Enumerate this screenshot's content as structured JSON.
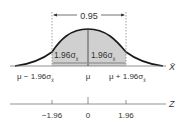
{
  "diagram": {
    "bracket_label": "0.95",
    "left_half_label": "1.96σ",
    "right_half_label": "1.96σ",
    "sub_label": "x̄",
    "xbar_axis": {
      "name": "X̄",
      "ticks": [
        {
          "label": "μ − 1.96σ",
          "sub": "x̄"
        },
        {
          "label": "μ",
          "sub": ""
        },
        {
          "label": "μ + 1.96σ",
          "sub": "x̄"
        }
      ]
    },
    "z_axis": {
      "name": "Z",
      "ticks": [
        "−1.96",
        "0",
        "1.96"
      ]
    },
    "colors": {
      "shade": "#cfcfcf",
      "curve": "#1a1a1a",
      "axis": "#555555",
      "text": "#333333"
    }
  }
}
